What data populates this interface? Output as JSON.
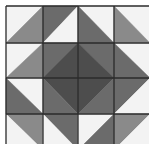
{
  "image": {
    "subject": "Quilt block pattern of half-square triangles forming a central diamond",
    "grid": {
      "rows": 4,
      "cols": 4
    },
    "colors": {
      "white": "#f3f3f3",
      "light": "#e6e6e6",
      "medium": "#8a8a8a",
      "dark": "#6b6b6b",
      "darkest": "#4d4d4d",
      "line": "#2b2b2b"
    },
    "cells": [
      [
        {
          "split": "/",
          "a": "white",
          "b": "medium"
        },
        {
          "split": "/",
          "a": "dark",
          "b": "white"
        },
        {
          "split": "\\",
          "a": "white",
          "b": "dark"
        },
        {
          "split": "\\",
          "a": "white",
          "b": "medium"
        }
      ],
      [
        {
          "split": "/",
          "a": "white",
          "b": "medium"
        },
        {
          "split": "/",
          "a": "dark",
          "b": "darkest"
        },
        {
          "split": "\\",
          "a": "dark",
          "b": "darkest"
        },
        {
          "split": "\\",
          "a": "white",
          "b": "dark"
        }
      ],
      [
        {
          "split": "\\",
          "a": "white",
          "b": "dark"
        },
        {
          "split": "\\",
          "a": "darkest",
          "b": "dark"
        },
        {
          "split": "/",
          "a": "darkest",
          "b": "dark"
        },
        {
          "split": "/",
          "a": "dark",
          "b": "white"
        }
      ],
      [
        {
          "split": "\\",
          "a": "medium",
          "b": "white"
        },
        {
          "split": "\\",
          "a": "dark",
          "b": "white"
        },
        {
          "split": "/",
          "a": "white",
          "b": "dark"
        },
        {
          "split": "/",
          "a": "medium",
          "b": "white"
        }
      ]
    ]
  }
}
